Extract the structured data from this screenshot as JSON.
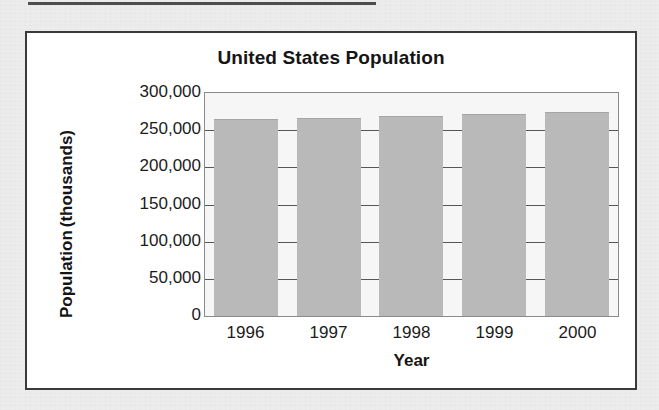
{
  "page": {
    "background_color": "#ececec",
    "rule_color": "#4e4e4e"
  },
  "figure": {
    "border_color": "#3a3a3a",
    "background_color": "#ffffff"
  },
  "chart_data": {
    "type": "bar",
    "title": "United States Population",
    "xlabel": "Year",
    "ylabel": "Population (thousands)",
    "ylabel_line1": "Population",
    "ylabel_line2": "(thousands)",
    "categories": [
      "1996",
      "1997",
      "1998",
      "1999",
      "2000"
    ],
    "values": [
      265000,
      267000,
      269000,
      272000,
      275000
    ],
    "ylim": [
      0,
      300000
    ],
    "yticks": [
      0,
      50000,
      100000,
      150000,
      200000,
      250000,
      300000
    ],
    "ytick_labels": [
      "0",
      "50,000",
      "100,000",
      "150,000",
      "200,000",
      "250,000",
      "300,000"
    ],
    "grid": true,
    "grid_axis": "y",
    "legend": false,
    "bar_color": "#b9b9b9",
    "plot_background": "#f6f6f6",
    "axis_color": "#8a8a8a",
    "gridline_color": "#575757"
  }
}
